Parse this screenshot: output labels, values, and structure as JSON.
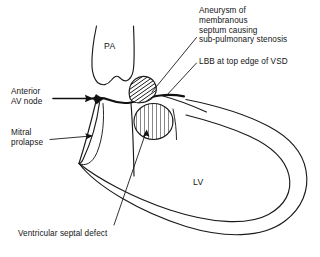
{
  "figure": {
    "background_color": "#ffffff",
    "ink_color": "#1a1a1a"
  },
  "labels": {
    "aneurysm": "Aneurysm of\nmembranous\nseptum causing\nsub-pulmonary stenosis",
    "lbb": "LBB at top edge of VSD",
    "av_node": "Anterior\nAV node",
    "mitral": "Mitral\nprolapse",
    "vsd": "Ventricular septal defect",
    "pa": "PA",
    "lv": "LV"
  },
  "structures": {
    "pulmonary_artery": "PA",
    "left_ventricle": "LV",
    "aneurysm_patch": "diagonal-hatched aneurysm of membranous septum",
    "vsd_patch": "vertical-hatched ventricular septal defect",
    "av_node_marker": "anterior AV node",
    "left_bundle_branch": "LBB"
  }
}
